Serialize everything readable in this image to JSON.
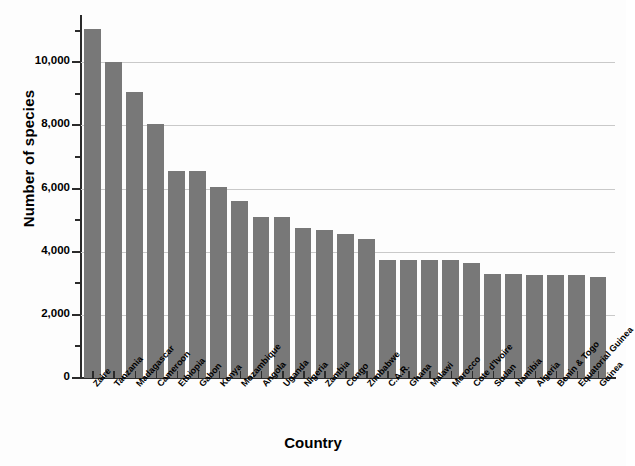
{
  "chart_data": {
    "type": "bar",
    "title": "",
    "xlabel": "Country",
    "ylabel": "Number of species",
    "ylim": [
      0,
      11500
    ],
    "yticks": [
      0,
      2000,
      4000,
      6000,
      8000,
      10000
    ],
    "ytick_labels": [
      "0",
      "2,000",
      "4,000",
      "6,000",
      "8,000",
      "10,000"
    ],
    "ytick_minor_step": 1000,
    "grid": "horizontal",
    "legend": "none",
    "bar_color": "#787878",
    "axis_color": "#2b2b2b",
    "grid_color": "#c9c9c9",
    "categories": [
      "Zaire",
      "Tanzania",
      "Madagascar",
      "Cameroon",
      "Ethiopia",
      "Gabon",
      "Kenya",
      "Mozambique",
      "Angola",
      "Uganda",
      "Nigeria",
      "Zambia",
      "Congo",
      "Zimbabwe",
      "C.A.R.",
      "Ghana",
      "Malawi",
      "Morocco",
      "Cote d'Ivoire",
      "Sudan",
      "Namibia",
      "Algeria",
      "Benin & Togo",
      "Equatorial Guinea",
      "Guinea"
    ],
    "values": [
      11050,
      10000,
      9050,
      8050,
      6550,
      6550,
      6050,
      5600,
      5100,
      5100,
      4750,
      4700,
      4550,
      4400,
      3750,
      3750,
      3750,
      3750,
      3650,
      3300,
      3300,
      3250,
      3250,
      3250,
      3200
    ]
  }
}
